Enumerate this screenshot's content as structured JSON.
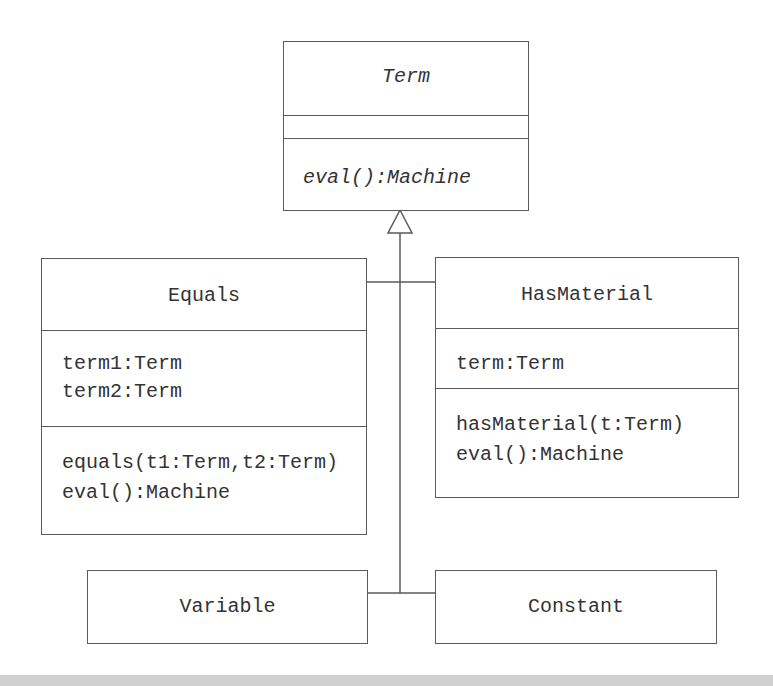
{
  "diagram": {
    "type": "UML class diagram",
    "classes": {
      "term": {
        "name": "Term",
        "abstract": true,
        "attributes": [],
        "operations": [
          "eval():Machine"
        ]
      },
      "equals": {
        "name": "Equals",
        "attributes": [
          "term1:Term",
          "term2:Term"
        ],
        "operations": [
          "equals(t1:Term,t2:Term)",
          "eval():Machine"
        ]
      },
      "has_material": {
        "name": "HasMaterial",
        "attributes": [
          "term:Term"
        ],
        "operations": [
          "hasMaterial(t:Term)",
          "eval():Machine"
        ]
      },
      "variable": {
        "name": "Variable"
      },
      "constant": {
        "name": "Constant"
      }
    },
    "relationships": [
      {
        "type": "generalization",
        "from": "Equals",
        "to": "Term"
      },
      {
        "type": "generalization",
        "from": "HasMaterial",
        "to": "Term"
      },
      {
        "type": "generalization",
        "from": "Variable",
        "to": "Term"
      },
      {
        "type": "generalization",
        "from": "Constant",
        "to": "Term"
      }
    ],
    "colors": {
      "line": "#5a5a5a",
      "text": "#333333",
      "background": "#ffffff",
      "footer_bar": "#d0d0d0"
    }
  }
}
